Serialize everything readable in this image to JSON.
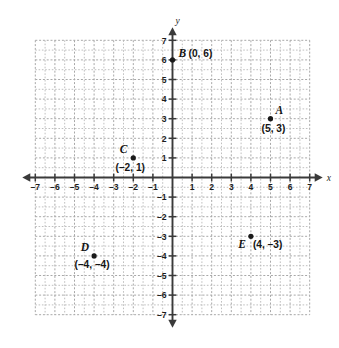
{
  "chart_data": {
    "type": "scatter",
    "title": "",
    "xlabel": "x",
    "ylabel": "y",
    "xlim": [
      -7,
      7
    ],
    "ylim": [
      -7,
      7
    ],
    "grid": true,
    "legend": "none",
    "x_ticks": [
      "-7",
      "-6",
      "-5",
      "-4",
      "-3",
      "-2",
      "-1",
      "1",
      "2",
      "3",
      "4",
      "5",
      "6",
      "7"
    ],
    "y_ticks": [
      "7",
      "6",
      "5",
      "4",
      "3",
      "2",
      "1",
      "-1",
      "-2",
      "-3",
      "-4",
      "-5",
      "-6",
      "-7"
    ],
    "points": [
      {
        "name": "A",
        "letter": "A",
        "x": 5,
        "y": 3,
        "coords_label": "(5, 3)",
        "letter_dx": 5,
        "letter_dy": -5,
        "letter_anchor": "start",
        "coords_dx": 3,
        "coords_dy": 13,
        "coords_anchor": "middle"
      },
      {
        "name": "B",
        "letter": "B",
        "x": 0,
        "y": 6,
        "coords_label": "(0, 6)",
        "letter_dx": 6,
        "letter_dy": -3,
        "letter_anchor": "start",
        "coords_dx": 16,
        "coords_dy": -3,
        "coords_anchor": "start"
      },
      {
        "name": "C",
        "letter": "C",
        "x": -2,
        "y": 1,
        "coords_label": "(–2, 1)",
        "letter_dx": -6,
        "letter_dy": -5,
        "letter_anchor": "end",
        "coords_dx": -3,
        "coords_dy": 13,
        "coords_anchor": "middle"
      },
      {
        "name": "D",
        "letter": "D",
        "x": -4,
        "y": -4,
        "coords_label": "(–4, –4)",
        "letter_dx": -5,
        "letter_dy": -5,
        "letter_anchor": "end",
        "coords_dx": -2,
        "coords_dy": 12,
        "coords_anchor": "middle"
      },
      {
        "name": "E",
        "letter": "E",
        "x": 4,
        "y": -3,
        "coords_label": "(4, –3)",
        "letter_dx": -5,
        "letter_dy": 12,
        "letter_anchor": "end",
        "coords_dx": 2,
        "coords_dy": 12,
        "coords_anchor": "start"
      }
    ]
  },
  "axes": {
    "x_axis_label": "x",
    "y_axis_label": "y"
  },
  "colors": {
    "grid": "#b9b9b9",
    "axis": "#3a3a3a",
    "point": "#1a1a1a",
    "text": "#141414",
    "background": "#ffffff"
  }
}
